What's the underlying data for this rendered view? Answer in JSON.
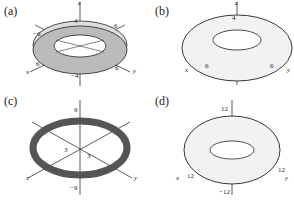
{
  "panels": [
    {
      "id": "a",
      "label": "(a)",
      "axes": {
        "x": "x",
        "y": "y",
        "z": "z"
      },
      "ticks": {
        "z_top": "4",
        "z_bottom": "−4",
        "x": "6",
        "y": "6",
        "neg_x": "−6",
        "neg_y": "6"
      }
    },
    {
      "id": "b",
      "label": "(b)",
      "axes": {
        "x": "x",
        "y": "y",
        "z": "z"
      },
      "ticks": {
        "z_top": "4",
        "x": "6",
        "y": "6"
      }
    },
    {
      "id": "c",
      "label": "(c)",
      "axes": {
        "x": "x",
        "y": "y",
        "z": "z"
      },
      "ticks": {
        "z_top": "9",
        "z_bottom": "−9",
        "x": "3",
        "y": "3"
      }
    },
    {
      "id": "d",
      "label": "(d)",
      "axes": {
        "x": "x",
        "y": "y",
        "z": "z"
      },
      "ticks": {
        "z_top": "12",
        "z_bottom": "−12",
        "x": "12",
        "y": "12"
      }
    }
  ]
}
